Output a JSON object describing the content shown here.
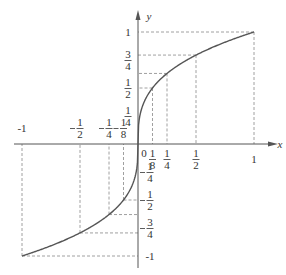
{
  "chart_data": {
    "type": "line",
    "title": "",
    "function": "y = cube root of x",
    "xlabel": "x",
    "ylabel": "y",
    "xlim": [
      -1,
      1
    ],
    "ylim": [
      -1,
      1
    ],
    "x_ticks": [
      "-1",
      "-1/2",
      "-1/4",
      "-1/8",
      "0",
      "1/8",
      "1/4",
      "1/2",
      "1"
    ],
    "y_ticks": [
      "1",
      "3/4",
      "1/2",
      "1/4",
      "-1/4",
      "-1/2",
      "-3/4",
      "-1"
    ],
    "points": [
      {
        "x": -1,
        "y": -1
      },
      {
        "x": -0.5,
        "y": -0.794
      },
      {
        "x": -0.25,
        "y": -0.63
      },
      {
        "x": -0.125,
        "y": -0.5
      },
      {
        "x": 0,
        "y": 0
      },
      {
        "x": 0.125,
        "y": 0.5
      },
      {
        "x": 0.25,
        "y": 0.63
      },
      {
        "x": 0.5,
        "y": 0.794
      },
      {
        "x": 1,
        "y": 1
      }
    ],
    "guides": "dashed lines from marked points to both axes",
    "grid": false
  },
  "axes": {
    "x_label": "x",
    "y_label": "y",
    "origin_label": "0"
  }
}
